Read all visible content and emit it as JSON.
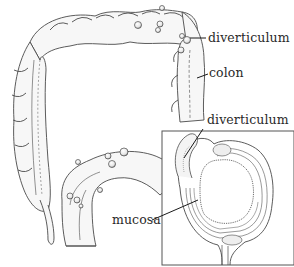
{
  "diagram": {
    "labels": {
      "diverticulum_top": "diverticulum",
      "colon": "colon",
      "diverticulum_inset": "diverticulum",
      "mucosa": "mucosa"
    },
    "colors": {
      "background": "#ffffff",
      "line": "#4a4a4a",
      "shade": "#d8d8d8",
      "text": "#2a2a2a",
      "inset_border": "#555555"
    }
  }
}
